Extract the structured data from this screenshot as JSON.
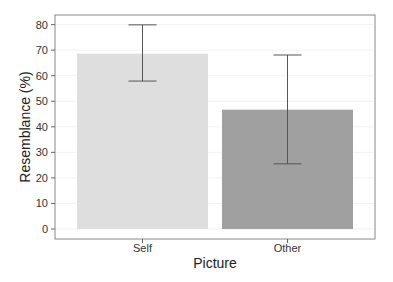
{
  "chart_data": {
    "type": "bar",
    "title": "",
    "xlabel": "Picture",
    "ylabel": "Resemblance (%)",
    "categories": [
      "Self",
      "Other"
    ],
    "values": [
      68.6,
      46.7
    ],
    "error_bars": [
      {
        "lower": 57.9,
        "upper": 79.9
      },
      {
        "lower": 25.5,
        "upper": 68.1
      }
    ],
    "bar_colors": [
      "#dedede",
      "#a0a0a0"
    ],
    "ylim": [
      0,
      80
    ],
    "yticks": [
      0,
      10,
      20,
      30,
      40,
      50,
      60,
      70,
      80
    ],
    "grid": true,
    "legend": null
  }
}
